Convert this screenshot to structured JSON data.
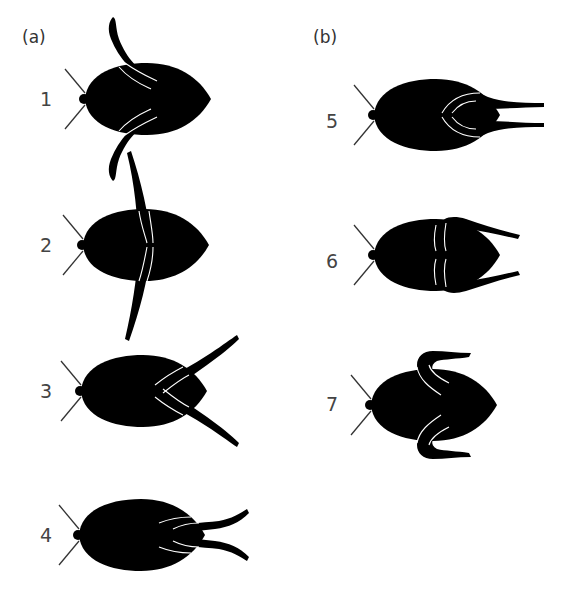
{
  "figure": {
    "panels": [
      {
        "id": "a",
        "label": "(a)",
        "stages": [
          "1",
          "2",
          "3",
          "4"
        ]
      },
      {
        "id": "b",
        "label": "(b)",
        "stages": [
          "5",
          "6",
          "7"
        ]
      }
    ],
    "stages": [
      {
        "number": "1",
        "panel": "a",
        "description": "hind legs folded forward along body"
      },
      {
        "number": "2",
        "panel": "a",
        "description": "hind legs extended perpendicular to body"
      },
      {
        "number": "3",
        "panel": "a",
        "description": "hind legs sweeping backward"
      },
      {
        "number": "4",
        "panel": "a",
        "description": "hind legs trailing behind body"
      },
      {
        "number": "5",
        "panel": "b",
        "description": "hind legs folded, trailing behind body"
      },
      {
        "number": "6",
        "panel": "b",
        "description": "hind legs bent outward, pointing back"
      },
      {
        "number": "7",
        "panel": "b",
        "description": "hind legs curled, recovery stroke"
      }
    ],
    "colors": {
      "body": "#000000",
      "leg_highlight": "#ffffff",
      "antenna": "#333333",
      "label": "#444444"
    }
  }
}
